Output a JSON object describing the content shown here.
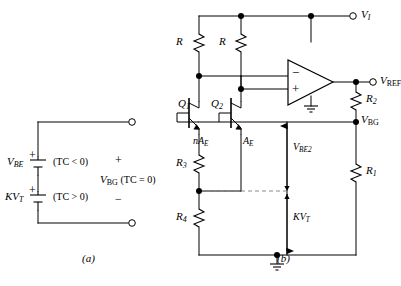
{
  "figure": {
    "type": "circuit-schematic",
    "background_color": "#ffffff",
    "line_color": "#000000",
    "dashed_color": "#999999",
    "panels": [
      {
        "id": "a",
        "caption": "(a)"
      },
      {
        "id": "b",
        "caption": "(b)"
      }
    ]
  },
  "panel_a": {
    "caption": "(a)",
    "sources": [
      {
        "name": "vbe-source",
        "label": "V",
        "sub": "BE",
        "tc_note": "(TC < 0)",
        "polarity_top": "+",
        "polarity_bottom": "−"
      },
      {
        "name": "kvt-source",
        "label": "KV",
        "sub": "T",
        "tc_note": "(TC > 0)",
        "polarity_top": "+",
        "polarity_bottom": "−"
      }
    ],
    "output": {
      "label": "V",
      "sub": "BG",
      "tc_note": "(TC = 0)",
      "plus": "+",
      "minus": "−"
    },
    "terminals": [
      "top-terminal",
      "bottom-terminal"
    ]
  },
  "panel_b": {
    "caption": "(b)",
    "nodes": [
      {
        "name": "vi-terminal",
        "label": "V",
        "sub": "I"
      },
      {
        "name": "vref-terminal",
        "label": "V",
        "sub": "REF"
      },
      {
        "name": "vbg-node",
        "label": "V",
        "sub": "BG"
      }
    ],
    "resistors": [
      {
        "name": "resistor-r-left",
        "label": "R",
        "sub": ""
      },
      {
        "name": "resistor-r-right",
        "label": "R",
        "sub": ""
      },
      {
        "name": "resistor-r2",
        "label": "R",
        "sub": "2"
      },
      {
        "name": "resistor-r1",
        "label": "R",
        "sub": "1"
      },
      {
        "name": "resistor-r3",
        "label": "R",
        "sub": "3"
      },
      {
        "name": "resistor-r4",
        "label": "R",
        "sub": "4"
      }
    ],
    "transistors": [
      {
        "name": "transistor-q1",
        "label": "Q",
        "sub": "1",
        "area_label": "nA",
        "area_sub": "E",
        "type": "npn"
      },
      {
        "name": "transistor-q2",
        "label": "Q",
        "sub": "2",
        "area_label": "A",
        "area_sub": "E",
        "type": "npn"
      }
    ],
    "opamp": {
      "name": "op-amp",
      "inverting_label": "−",
      "noninverting_label": "+",
      "ground": "ground-symbol-opamp"
    },
    "voltage_arrows": [
      {
        "name": "vbe2-arrow",
        "label": "V",
        "sub": "BE2",
        "direction": "up"
      },
      {
        "name": "kvt-arrow",
        "label": "KV",
        "sub": "T",
        "direction": "down"
      }
    ],
    "ground": {
      "name": "ground-symbol-main"
    },
    "dashed_connection": {
      "name": "dashed-link",
      "style": "dashed"
    }
  }
}
